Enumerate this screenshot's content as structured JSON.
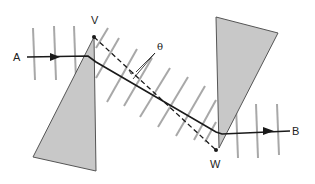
{
  "labels": {
    "A": "A",
    "B": "B",
    "V": "V",
    "W": "W",
    "theta": "θ"
  },
  "colors": {
    "prism_fill": "#c8c8c8",
    "prism_stroke": "#555555",
    "ray": "#1a1a1a",
    "wavefront": "#a8a8a8",
    "dashed": "#1a1a1a",
    "background": "#ffffff"
  },
  "elements": {
    "left_prism": "triangular prism with apex V at top",
    "right_prism": "inverted triangular prism with apex W at bottom",
    "ray": "ray from A refracted through both prisms to B",
    "dashed_line": "line connecting V and W",
    "angle": "θ between ray and dashed line"
  }
}
